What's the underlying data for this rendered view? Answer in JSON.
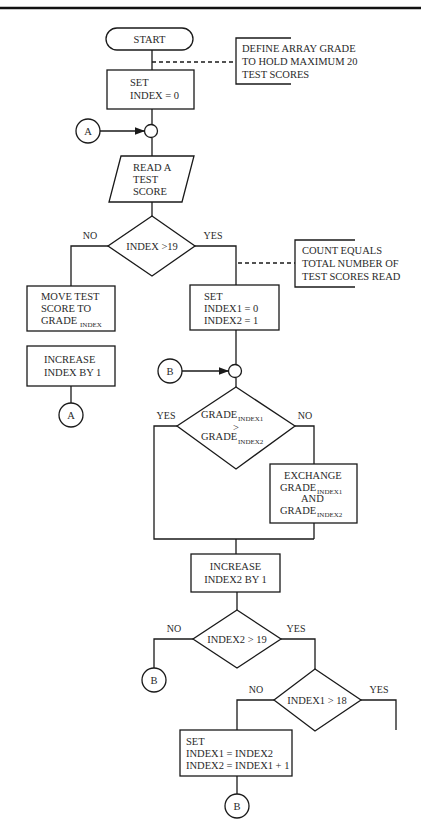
{
  "flowchart": {
    "start": "START",
    "annotation1": [
      "DEFINE ARRAY GRADE",
      "TO HOLD MAXIMUM 20",
      "TEST SCORES"
    ],
    "set_index": [
      "SET",
      "INDEX = 0"
    ],
    "connector_a": "A",
    "read_score": [
      "READ A",
      "TEST",
      "SCORE"
    ],
    "decision1": "INDEX >19",
    "decision1_no": "NO",
    "decision1_yes": "YES",
    "annotation2": [
      "COUNT EQUALS",
      "TOTAL NUMBER OF",
      "TEST SCORES READ"
    ],
    "move_score": [
      "MOVE TEST",
      "SCORE TO",
      "GRADE"
    ],
    "move_score_sub": "INDEX",
    "increase_index": [
      "INCREASE",
      "INDEX BY 1"
    ],
    "set_index12": [
      "SET",
      "INDEX1 = 0",
      "INDEX2 = 1"
    ],
    "connector_b": "B",
    "decision2_main": "GRADE",
    "decision2_sub1": "INDEX1",
    "decision2_op": ">",
    "decision2_sub2": "INDEX2",
    "decision2_yes": "YES",
    "decision2_no": "NO",
    "exchange_title": "EXCHANGE",
    "exchange_grade": "GRADE",
    "exchange_sub1": "INDEX1",
    "exchange_and": "AND",
    "exchange_sub2": "INDEX2",
    "increase_index2": [
      "INCREASE",
      "INDEX2 BY 1"
    ],
    "decision3": "INDEX2 > 19",
    "decision3_no": "NO",
    "decision3_yes": "YES",
    "decision4": "INDEX1 > 18",
    "decision4_no": "NO",
    "decision4_yes": "YES",
    "set_final": [
      "SET",
      "INDEX1 = INDEX2",
      "INDEX2 = INDEX1 + 1"
    ]
  }
}
